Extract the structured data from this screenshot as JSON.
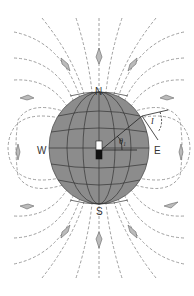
{
  "diagram": {
    "labels": {
      "north": "N",
      "south": "S",
      "west": "W",
      "east": "E",
      "latitude_angle": "θ₁",
      "inclination_angle": "I"
    },
    "colors": {
      "globe_fill": "#8c8c8c",
      "grid_lines": "#333333",
      "field_lines": "#777777",
      "compass": "#999999",
      "magnet_north": "#ffffff",
      "magnet_south": "#111111"
    },
    "elements": {
      "globe": "Earth sphere with latitude/longitude grid",
      "magnet": "Bar magnet at center (white top, black bottom)",
      "field_lines": "Dashed dipole field lines",
      "compasses": "Diamond-shaped compass needles along field lines"
    }
  }
}
